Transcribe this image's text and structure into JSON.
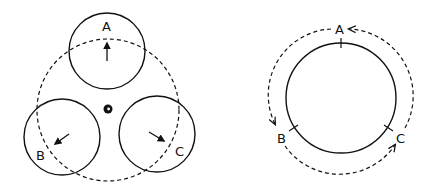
{
  "colors": {
    "stroke": "#111111",
    "background": "#ffffff"
  },
  "left_diagram": {
    "description": "Three circles A, B, C arranged on a dashed orbit around a center point, each with an outward arrow",
    "circles": [
      {
        "label": "A",
        "arrow_direction": "up"
      },
      {
        "label": "B",
        "arrow_direction": "down-left"
      },
      {
        "label": "C",
        "arrow_direction": "down-right"
      }
    ],
    "center_marker": "center-dot",
    "orbit_style": "dashed"
  },
  "right_diagram": {
    "description": "Solid circle with tick marks at A, B, C; dashed arrows circulate around the outside counterclockwise A to B to C to A",
    "points": [
      {
        "label": "A"
      },
      {
        "label": "B"
      },
      {
        "label": "C"
      }
    ],
    "ring_style": "solid",
    "flow_style": "dashed-arrows"
  }
}
